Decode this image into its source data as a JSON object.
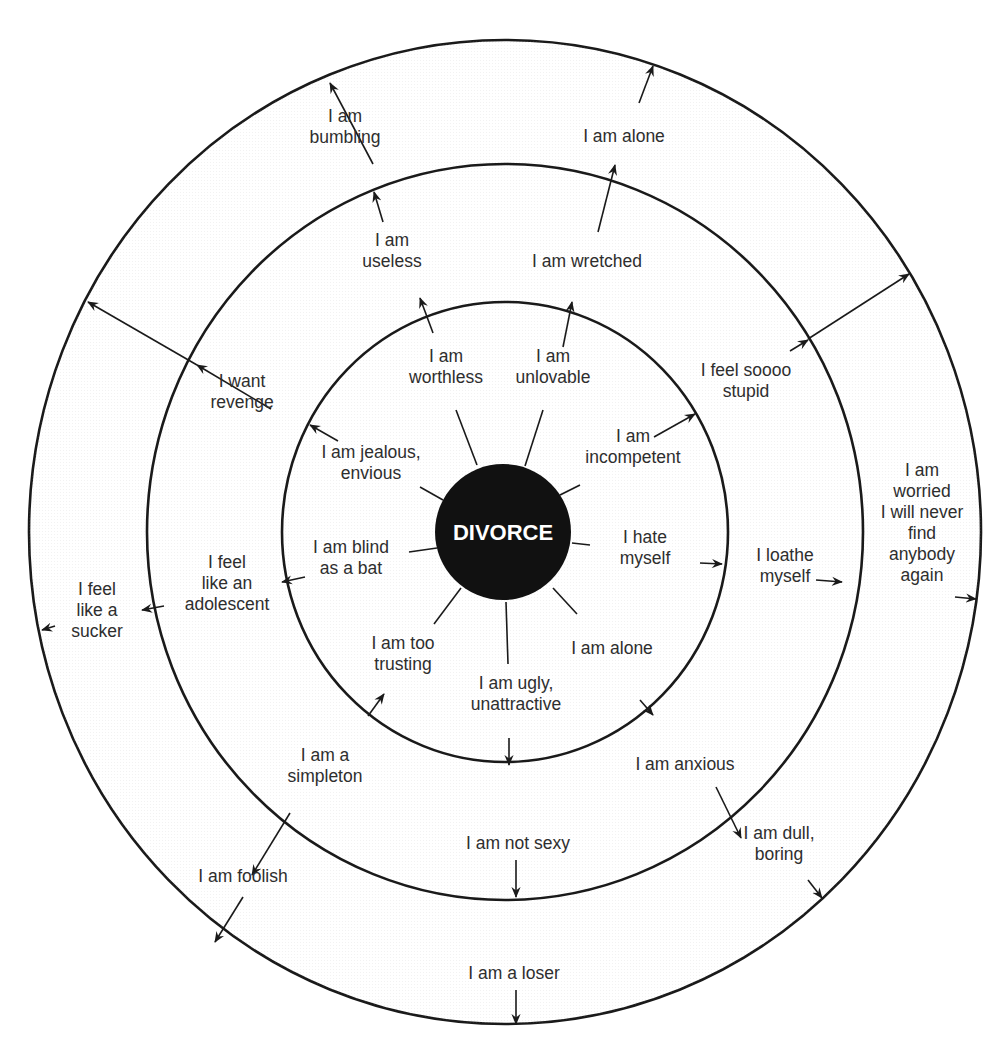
{
  "diagram": {
    "title": "",
    "center_label": "DIVORCE",
    "colors": {
      "background": "#ffffff",
      "outer_ring_fill": "#f0f0f0",
      "middle_ring_fill": "#e2e2e2",
      "inner_ring_fill": "#d4d4d4",
      "core_fill": "#111111",
      "line": "#1a1a1a",
      "text": "#2e2e2e"
    },
    "geometry": {
      "center": [
        505,
        532
      ],
      "outer": {
        "rx": 476,
        "ry": 492
      },
      "middle": {
        "rx": 358,
        "ry": 368
      },
      "inner": {
        "rx": 223,
        "ry": 230
      },
      "core_r": 68
    },
    "rings": [
      {
        "level": "inner",
        "labels": [
          {
            "id": "worthless",
            "lines": [
              "I am",
              "worthless"
            ],
            "x": 446,
            "y": 366
          },
          {
            "id": "unlovable",
            "lines": [
              "I am",
              "unlovable"
            ],
            "x": 553,
            "y": 366
          },
          {
            "id": "incompetent",
            "lines": [
              "I am",
              "incompetent"
            ],
            "x": 633,
            "y": 446
          },
          {
            "id": "jealous",
            "lines": [
              "I am jealous,",
              "envious"
            ],
            "x": 371,
            "y": 462
          },
          {
            "id": "blind",
            "lines": [
              "I am blind",
              "as a bat"
            ],
            "x": 351,
            "y": 557
          },
          {
            "id": "hate-myself",
            "lines": [
              "I hate",
              "myself"
            ],
            "x": 645,
            "y": 547
          },
          {
            "id": "too-trusting",
            "lines": [
              "I am too",
              "trusting"
            ],
            "x": 403,
            "y": 653
          },
          {
            "id": "alone-inner",
            "lines": [
              "I am alone"
            ],
            "x": 612,
            "y": 648
          },
          {
            "id": "ugly",
            "lines": [
              "I am ugly,",
              "unattractive"
            ],
            "x": 516,
            "y": 693
          }
        ]
      },
      {
        "level": "middle",
        "labels": [
          {
            "id": "useless",
            "lines": [
              "I am",
              "useless"
            ],
            "x": 392,
            "y": 250
          },
          {
            "id": "wretched",
            "lines": [
              "I am wretched"
            ],
            "x": 587,
            "y": 261
          },
          {
            "id": "soooo-stupid",
            "lines": [
              "I feel soooo",
              "stupid"
            ],
            "x": 746,
            "y": 380
          },
          {
            "id": "revenge",
            "lines": [
              "I want",
              "revenge"
            ],
            "x": 242,
            "y": 391
          },
          {
            "id": "adolescent",
            "lines": [
              "I feel",
              "like an",
              "adolescent"
            ],
            "x": 227,
            "y": 583
          },
          {
            "id": "loathe-myself",
            "lines": [
              "I loathe",
              "myself"
            ],
            "x": 785,
            "y": 565
          },
          {
            "id": "simpleton",
            "lines": [
              "I am a",
              "simpleton"
            ],
            "x": 325,
            "y": 765
          },
          {
            "id": "anxious",
            "lines": [
              "I am anxious"
            ],
            "x": 685,
            "y": 764
          },
          {
            "id": "not-sexy",
            "lines": [
              "I am not sexy"
            ],
            "x": 518,
            "y": 843
          }
        ]
      },
      {
        "level": "outer",
        "labels": [
          {
            "id": "bumbling",
            "lines": [
              "I am",
              "bumbling"
            ],
            "x": 345,
            "y": 126
          },
          {
            "id": "alone-outer",
            "lines": [
              "I am alone"
            ],
            "x": 624,
            "y": 136
          },
          {
            "id": "sucker",
            "lines": [
              "I feel",
              "like a",
              "sucker"
            ],
            "x": 97,
            "y": 610
          },
          {
            "id": "worried",
            "lines": [
              "I am",
              "worried",
              "I will never",
              "find",
              "anybody",
              "again"
            ],
            "x": 922,
            "y": 522
          },
          {
            "id": "foolish",
            "lines": [
              "I am foolish"
            ],
            "x": 243,
            "y": 876
          },
          {
            "id": "dull-boring",
            "lines": [
              "I am dull,",
              "boring"
            ],
            "x": 779,
            "y": 843
          },
          {
            "id": "loser",
            "lines": [
              "I am a loser"
            ],
            "x": 514,
            "y": 973
          }
        ]
      }
    ],
    "spokes": [
      {
        "from": [
          477,
          465
        ],
        "to": [
          456,
          410
        ]
      },
      {
        "from": [
          525,
          466
        ],
        "to": [
          543,
          410
        ]
      },
      {
        "from": [
          560,
          495
        ],
        "to": [
          580,
          485
        ]
      },
      {
        "from": [
          443,
          500
        ],
        "to": [
          420,
          487
        ]
      },
      {
        "from": [
          437,
          548
        ],
        "to": [
          409,
          552
        ]
      },
      {
        "from": [
          572,
          543
        ],
        "to": [
          590,
          545
        ]
      },
      {
        "from": [
          461,
          588
        ],
        "to": [
          434,
          624
        ]
      },
      {
        "from": [
          553,
          588
        ],
        "to": [
          577,
          614
        ]
      },
      {
        "from": [
          506,
          602
        ],
        "to": [
          508,
          664
        ]
      }
    ],
    "arrows": [
      {
        "from": [
          433,
          333
        ],
        "to": [
          420,
          298
        ]
      },
      {
        "from": [
          563,
          347
        ],
        "to": [
          572,
          302
        ]
      },
      {
        "from": [
          654,
          437
        ],
        "to": [
          695,
          414
        ]
      },
      {
        "from": [
          338,
          441
        ],
        "to": [
          310,
          425
        ]
      },
      {
        "from": [
          305,
          577
        ],
        "to": [
          282,
          582
        ]
      },
      {
        "from": [
          700,
          563
        ],
        "to": [
          722,
          564
        ]
      },
      {
        "from": [
          368,
          716
        ],
        "to": [
          384,
          694
        ]
      },
      {
        "from": [
          640,
          700
        ],
        "to": [
          653,
          715
        ]
      },
      {
        "from": [
          509,
          738
        ],
        "to": [
          509,
          765
        ]
      },
      {
        "from": [
          383,
          222
        ],
        "to": [
          374,
          192
        ]
      },
      {
        "from": [
          598,
          232
        ],
        "to": [
          615,
          165
        ]
      },
      {
        "from": [
          790,
          351
        ],
        "to": [
          808,
          340
        ]
      },
      {
        "from": [
          271,
          409
        ],
        "to": [
          197,
          365
        ]
      },
      {
        "from": [
          164,
          606
        ],
        "to": [
          142,
          610
        ]
      },
      {
        "from": [
          816,
          580
        ],
        "to": [
          842,
          582
        ]
      },
      {
        "from": [
          290,
          813
        ],
        "to": [
          252,
          875
        ]
      },
      {
        "from": [
          716,
          787
        ],
        "to": [
          741,
          838
        ]
      },
      {
        "from": [
          516,
          860
        ],
        "to": [
          516,
          897
        ]
      },
      {
        "from": [
          373,
          164
        ],
        "to": [
          330,
          83
        ]
      },
      {
        "from": [
          639,
          103
        ],
        "to": [
          653,
          66
        ]
      },
      {
        "from": [
          808,
          339
        ],
        "to": [
          909,
          274
        ]
      },
      {
        "from": [
          197,
          365
        ],
        "to": [
          88,
          302
        ]
      },
      {
        "from": [
          55,
          626
        ],
        "to": [
          42,
          630
        ]
      },
      {
        "from": [
          955,
          597
        ],
        "to": [
          976,
          599
        ]
      },
      {
        "from": [
          243,
          897
        ],
        "to": [
          215,
          942
        ]
      },
      {
        "from": [
          808,
          880
        ],
        "to": [
          822,
          898
        ]
      },
      {
        "from": [
          516,
          990
        ],
        "to": [
          516,
          1024
        ]
      }
    ]
  }
}
